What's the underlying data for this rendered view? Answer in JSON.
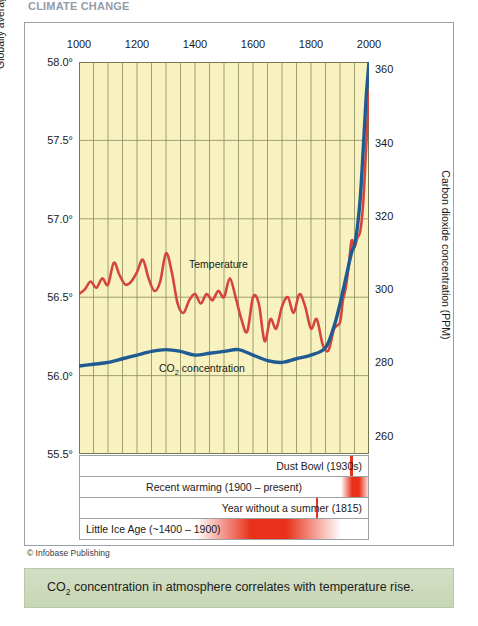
{
  "page": {
    "top_title": "CLIMATE CHANGE",
    "credit": "© Infobase Publishing",
    "caption_pre": "CO",
    "caption_sub": "2",
    "caption_post": " concentration in atmosphere correlates with temperature rise."
  },
  "colors": {
    "temperature": "#d6453c",
    "co2": "#1f5b92",
    "plot_background": "#f7f2bf",
    "grid": "#8a8a5e",
    "caption_band": "#cfdcc0",
    "bar_red": "#e8301a"
  },
  "chart_data": {
    "type": "line",
    "xlabel": "",
    "xlim": [
      1000,
      2000
    ],
    "xticks": [
      1000,
      1200,
      1400,
      1600,
      1800,
      2000
    ],
    "xtick_labels": [
      "1000",
      "1200",
      "1400",
      "1600",
      "1800",
      "2000"
    ],
    "grid": true,
    "grid_x_step": 50,
    "legend": "inline-labels",
    "axes": [
      {
        "side": "left",
        "ylabel": "Globally averaged surface temperature (°F)",
        "ylim": [
          55.5,
          58.0
        ],
        "yticks": [
          55.5,
          56.0,
          56.5,
          57.0,
          57.5,
          58.0
        ],
        "ytick_labels": [
          "55.5°",
          "56.0°",
          "56.5°",
          "57.0°",
          "57.5°",
          "58.0°"
        ]
      },
      {
        "side": "right",
        "ylabel": "Carbon dioxide concentration (PPM)",
        "ylim": [
          255,
          362
        ],
        "yticks": [
          260,
          280,
          300,
          320,
          340,
          360
        ],
        "ytick_labels": [
          "260",
          "280",
          "300",
          "320",
          "340",
          "360"
        ]
      }
    ],
    "series": [
      {
        "name": "Temperature",
        "label": "Temperature",
        "color": "#d6453c",
        "axis": "left",
        "units": "°F",
        "x": [
          1000,
          1020,
          1040,
          1060,
          1080,
          1100,
          1120,
          1140,
          1160,
          1180,
          1200,
          1220,
          1240,
          1260,
          1280,
          1300,
          1320,
          1340,
          1360,
          1380,
          1400,
          1420,
          1440,
          1460,
          1480,
          1500,
          1520,
          1540,
          1560,
          1580,
          1600,
          1620,
          1640,
          1660,
          1680,
          1700,
          1720,
          1740,
          1760,
          1780,
          1800,
          1820,
          1840,
          1860,
          1880,
          1900,
          1910,
          1920,
          1930,
          1940,
          1950,
          1960,
          1970,
          1980,
          1990,
          2000
        ],
        "y": [
          56.52,
          56.55,
          56.6,
          56.56,
          56.62,
          56.58,
          56.72,
          56.64,
          56.58,
          56.6,
          56.66,
          56.74,
          56.62,
          56.54,
          56.6,
          56.78,
          56.66,
          56.46,
          56.4,
          56.48,
          56.52,
          56.46,
          56.52,
          56.48,
          56.54,
          56.5,
          56.62,
          56.5,
          56.36,
          56.28,
          56.5,
          56.46,
          56.22,
          56.36,
          56.3,
          56.44,
          56.5,
          56.4,
          56.52,
          56.44,
          56.3,
          56.36,
          56.2,
          56.16,
          56.3,
          56.34,
          56.48,
          56.56,
          56.7,
          56.86,
          56.82,
          56.88,
          56.92,
          57.1,
          57.45,
          57.82
        ]
      },
      {
        "name": "CO2 concentration",
        "label": "CO₂ concentration",
        "color": "#1f5b92",
        "axis": "right",
        "units": "PPM",
        "x": [
          1000,
          1050,
          1100,
          1150,
          1200,
          1250,
          1300,
          1350,
          1400,
          1450,
          1500,
          1550,
          1600,
          1650,
          1700,
          1750,
          1800,
          1850,
          1880,
          1900,
          1920,
          1940,
          1950,
          1960,
          1970,
          1980,
          1990,
          2000
        ],
        "y": [
          279,
          279.5,
          280,
          281,
          282,
          283,
          283.5,
          283,
          282,
          282.5,
          283,
          283.5,
          282,
          280.5,
          280,
          281,
          282,
          284,
          290,
          296,
          303,
          310,
          312,
          317,
          325,
          338,
          352,
          362
        ]
      }
    ],
    "annotations": [
      {
        "label": "Dust Bowl (1930s)",
        "start": 1930,
        "end": 1940,
        "text_align": "right"
      },
      {
        "label": "Recent warming (1900 – present)",
        "start": 1900,
        "end": 2000,
        "text_align": "center"
      },
      {
        "label": "Year without a summer (1815)",
        "start": 1813,
        "end": 1818,
        "text_align": "right"
      },
      {
        "label": "Little Ice Age (~1400 – 1900)",
        "start": 1400,
        "end": 1900,
        "text_align": "left"
      }
    ]
  }
}
